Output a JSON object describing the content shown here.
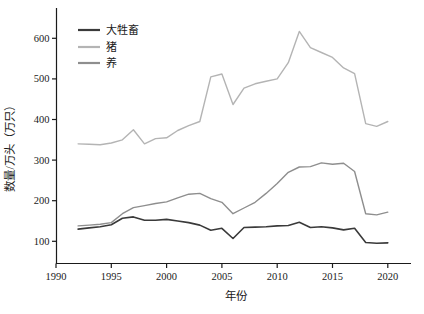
{
  "figure": {
    "background": "#ffffff",
    "axis_color": "#1a1a1a",
    "text_color": "#1a1a1a"
  },
  "chart_data": {
    "type": "line",
    "title": "",
    "xlabel": "年份",
    "ylabel": "数量/万头（万只）",
    "grid": false,
    "legend_position": "upper-left",
    "xlim": [
      1990,
      2022
    ],
    "ylim": [
      45,
      660
    ],
    "xticks": [
      1990,
      1995,
      2000,
      2005,
      2010,
      2015,
      2020
    ],
    "yticks": [
      100,
      200,
      300,
      400,
      500,
      600
    ],
    "x": [
      1992,
      1993,
      1994,
      1995,
      1996,
      1997,
      1998,
      1999,
      2000,
      2001,
      2002,
      2003,
      2004,
      2005,
      2006,
      2007,
      2008,
      2009,
      2010,
      2011,
      2012,
      2013,
      2014,
      2015,
      2016,
      2017,
      2018,
      2019,
      2020
    ],
    "series": [
      {
        "name": "大牲畜",
        "color": "#3a3a3a",
        "line_width": 1.6,
        "values": [
          130,
          133,
          136,
          141,
          157,
          160,
          152,
          152,
          154,
          150,
          146,
          140,
          127,
          132,
          107,
          134,
          135,
          136,
          138,
          139,
          147,
          134,
          136,
          133,
          128,
          132,
          97,
          95,
          96
        ]
      },
      {
        "name": "猪",
        "color": "#b4b4b4",
        "line_width": 1.4,
        "values": [
          340,
          339,
          338,
          342,
          350,
          375,
          340,
          353,
          355,
          373,
          385,
          395,
          505,
          512,
          437,
          477,
          488,
          494,
          500,
          540,
          617,
          577,
          565,
          553,
          527,
          513,
          390,
          383,
          395
        ]
      },
      {
        "name": "养",
        "color": "#8e8e8e",
        "line_width": 1.4,
        "values": [
          138,
          140,
          142,
          146,
          168,
          183,
          188,
          193,
          197,
          207,
          216,
          218,
          205,
          196,
          168,
          182,
          196,
          218,
          242,
          270,
          283,
          284,
          293,
          290,
          292,
          272,
          168,
          165,
          172
        ]
      }
    ]
  }
}
